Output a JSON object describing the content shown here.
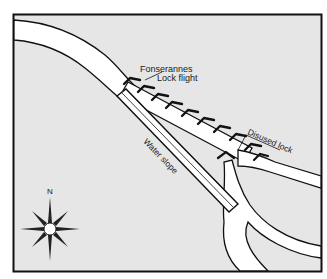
{
  "diagram": {
    "type": "map",
    "frame": {
      "background": "#e6e6e6",
      "border": "#111111",
      "water": "#ffffff"
    },
    "labels": {
      "lock_flight_line1": "Fonserannes",
      "lock_flight_line2": "Lock flight",
      "water_slope": "Water slope",
      "disused_lock": "Disused lock",
      "compass_north": "N"
    },
    "features": [
      {
        "name": "Fonserannes Lock flight",
        "kind": "lock staircase"
      },
      {
        "name": "Water slope",
        "kind": "inclined channel"
      },
      {
        "name": "Disused lock",
        "kind": "lock"
      },
      {
        "name": "Compass rose",
        "kind": "north indicator"
      }
    ]
  }
}
